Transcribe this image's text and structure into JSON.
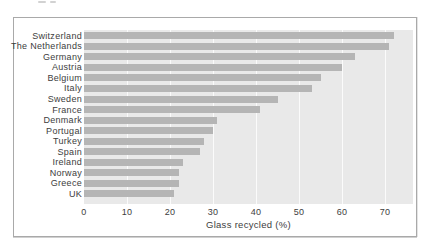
{
  "chart_data": {
    "type": "bar",
    "orientation": "horizontal",
    "xlabel": "Glass recycled (%)",
    "categories": [
      "Switzerland",
      "The Netherlands",
      "Germany",
      "Austria",
      "Belgium",
      "Italy",
      "Sweden",
      "France",
      "Denmark",
      "Portugal",
      "Turkey",
      "Spain",
      "Ireland",
      "Norway",
      "Greece",
      "UK"
    ],
    "values": [
      72,
      71,
      63,
      60,
      55,
      53,
      45,
      41,
      31,
      30,
      28,
      27,
      23,
      22,
      22,
      21
    ],
    "x_ticks": [
      "0",
      "10",
      "20",
      "30",
      "40",
      "50",
      "60",
      "70"
    ],
    "x_tick_values": [
      0,
      10,
      20,
      30,
      40,
      50,
      60,
      70
    ],
    "xlim": [
      0,
      76.5
    ],
    "grid": "vertical",
    "legend": "none",
    "colors": {
      "bar": "#b5b5b5",
      "plot_background": "#e9e9e9",
      "gridline": "#fbfbfb",
      "frame_border": "#a9a9a9",
      "text": "#3d3d3d"
    }
  }
}
